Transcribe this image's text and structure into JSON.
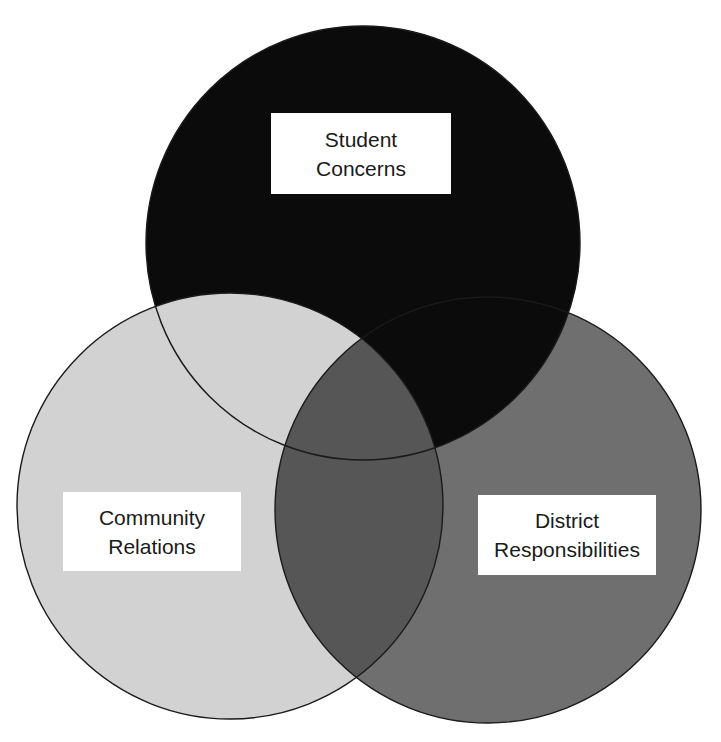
{
  "diagram": {
    "type": "venn",
    "sets": [
      {
        "id": "student",
        "label_lines": [
          "Student",
          "Concerns"
        ],
        "fill": "#0b0b0b",
        "position": "top"
      },
      {
        "id": "community",
        "label_lines": [
          "Community",
          "Relations"
        ],
        "fill": "#d2d2d2",
        "position": "bottom-left"
      },
      {
        "id": "district",
        "label_lines": [
          "District",
          "Responsibilities"
        ],
        "fill": "#6f6f6f",
        "position": "bottom-right"
      }
    ],
    "overlap_colors": {
      "community_district": "#565656"
    },
    "outline_color": "#1a1a1a",
    "background": "#ffffff"
  }
}
